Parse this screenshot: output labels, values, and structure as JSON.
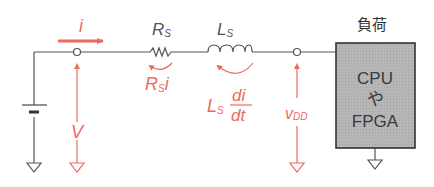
{
  "diagram": {
    "type": "circuit",
    "colors": {
      "wire": "#555555",
      "annotation": "#ec6a62",
      "load_fill": "#b4b4b4",
      "load_border": "#333333"
    },
    "current": {
      "symbol": "i"
    },
    "source_voltage": {
      "symbol": "V"
    },
    "resistor": {
      "name_main": "R",
      "name_sub": "S",
      "drop_main": "R",
      "drop_sub": "S",
      "drop_tail": "i"
    },
    "inductor": {
      "name_main": "L",
      "name_sub": "S",
      "drop_main": "L",
      "drop_sub": "S",
      "drop_num": "di",
      "drop_den": "dt"
    },
    "load_voltage": {
      "main": "v",
      "sub": "DD"
    },
    "load": {
      "title": "負荷",
      "lines": [
        "CPU",
        "や",
        "FPGA"
      ]
    }
  }
}
